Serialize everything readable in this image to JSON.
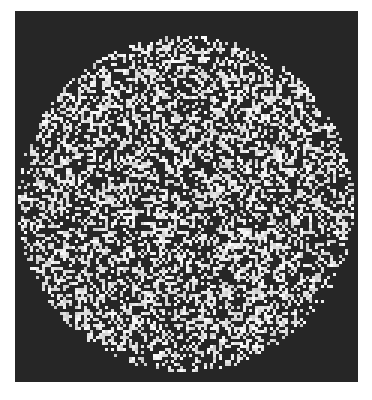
{
  "image": {
    "description": "Random-dot noise pattern confined to a circle on a dark square background",
    "background_color": "#ffffff",
    "panel": {
      "x": 15,
      "y": 11,
      "width": 343,
      "height": 371,
      "color": "#262626"
    },
    "disk": {
      "cx": 186,
      "cy": 204,
      "r": 168
    },
    "dot_color": "#e8e8e8",
    "dot_density": 0.42,
    "dot_size": 3,
    "seed": 12345
  }
}
